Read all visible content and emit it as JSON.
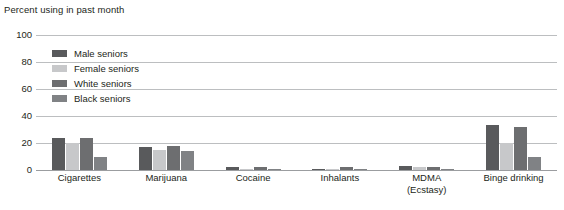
{
  "chart_data": {
    "type": "bar",
    "title": "Percent using in past month",
    "xlabel": "",
    "ylabel": "Percent using in past month",
    "ylim": [
      0,
      100
    ],
    "yticks": [
      0,
      20,
      40,
      60,
      80,
      100
    ],
    "grid": true,
    "legend_position": "inside-top-left",
    "categories": [
      "Cigarettes",
      "Marijuana",
      "Cocaine",
      "Inhalants",
      "MDMA (Ecstasy)",
      "Binge drinking"
    ],
    "category_lines": [
      [
        "Cigarettes"
      ],
      [
        "Marijuana"
      ],
      [
        "Cocaine"
      ],
      [
        "Inhalants"
      ],
      [
        "MDMA",
        "(Ecstasy)"
      ],
      [
        "Binge drinking"
      ]
    ],
    "series": [
      {
        "name": "Male seniors",
        "color": "#595a5c",
        "values": [
          24,
          17,
          2,
          1,
          3,
          33
        ]
      },
      {
        "name": "Female seniors",
        "color": "#c7c8ca",
        "values": [
          20,
          15,
          1,
          1,
          2,
          20
        ]
      },
      {
        "name": "White seniors",
        "color": "#6d6e70",
        "values": [
          24,
          18,
          2,
          2,
          2,
          32
        ]
      },
      {
        "name": "Black seniors",
        "color": "#808285",
        "values": [
          10,
          14,
          1,
          1,
          1,
          10
        ]
      }
    ]
  },
  "axis": {
    "title": "Percent using in past month",
    "yticks": [
      "100",
      "80",
      "60",
      "40",
      "20",
      "0"
    ]
  },
  "legend": {
    "items": [
      {
        "label": "Male seniors"
      },
      {
        "label": "Female seniors"
      },
      {
        "label": "White seniors"
      },
      {
        "label": "Black seniors"
      }
    ]
  },
  "colors": {
    "gridline": "#bcbec0",
    "baseline": "#9b9da0",
    "text": "#231f20",
    "background": "#ffffff"
  }
}
